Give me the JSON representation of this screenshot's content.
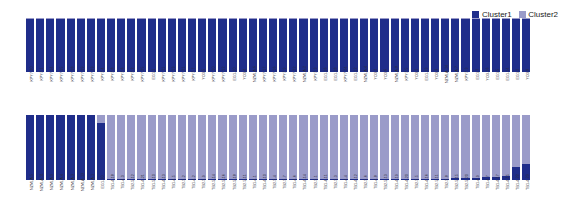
{
  "legend": {
    "position": "top-right",
    "entries": [
      {
        "label": "Cluster1",
        "color": "#1f2d8a",
        "swatch_name": "cluster1-swatch"
      },
      {
        "label": "Cluster2",
        "color": "#9a9bc9",
        "swatch_name": "cluster2-swatch"
      }
    ]
  },
  "chart_data": {
    "type": "bar",
    "subtype": "stacked-structure-admixture",
    "title": "",
    "subtitle": "",
    "xlabel": "",
    "ylabel": "",
    "ylim": [
      0,
      1
    ],
    "grid": false,
    "legend_position": "top-right",
    "stacked": true,
    "normalized": true,
    "k": 2,
    "series": [
      {
        "name": "Cluster1",
        "color": "#1f2d8a"
      },
      {
        "name": "Cluster2",
        "color": "#9a9bc9"
      }
    ],
    "panels": [
      {
        "name": "top-panel",
        "categories": [
          "KPY7-20",
          "KPY7-1",
          "KPY7-14",
          "KPY7-15",
          "KPY7-18",
          "KPY7-19",
          "KPY7-23",
          "KPY7-4",
          "KPY7-8",
          "KPY7-6",
          "KPY7-2",
          "KPY7-25",
          "EG1-1",
          "KPY7-11",
          "KPY7-13",
          "KPY7-21",
          "KPY7-7",
          "YO3-5",
          "KPY7-10",
          "KPY7-12",
          "EG1-10",
          "YO3-4",
          "NZMLA-6",
          "KPY7-17",
          "KPY7-16",
          "KPY7-9",
          "KPY7-22",
          "NZMLA-2",
          "KPY7-3",
          "EG1-16",
          "EG1-18",
          "KPY7-24",
          "EG1-12",
          "NZMLA-4",
          "YO3-2",
          "YO3-6",
          "NZMLA-8",
          "KPY7-5",
          "YO3-1",
          "EG1-13",
          "YO3-3",
          "NZMLA-14",
          "NZMLA-7",
          "KPY7-3",
          "EG1-7",
          "YO3-16",
          "EG1-5",
          "EG1-14",
          "EG1-2",
          "YO3-8"
        ],
        "values": [
          [
            0.99,
            0.01
          ],
          [
            0.99,
            0.01
          ],
          [
            0.99,
            0.01
          ],
          [
            0.99,
            0.01
          ],
          [
            0.99,
            0.01
          ],
          [
            0.99,
            0.01
          ],
          [
            0.98,
            0.02
          ],
          [
            0.99,
            0.01
          ],
          [
            0.99,
            0.01
          ],
          [
            0.99,
            0.01
          ],
          [
            0.98,
            0.02
          ],
          [
            0.99,
            0.01
          ],
          [
            0.99,
            0.01
          ],
          [
            0.99,
            0.01
          ],
          [
            0.98,
            0.02
          ],
          [
            0.99,
            0.01
          ],
          [
            0.99,
            0.01
          ],
          [
            0.98,
            0.02
          ],
          [
            0.99,
            0.01
          ],
          [
            0.99,
            0.01
          ],
          [
            0.98,
            0.02
          ],
          [
            0.99,
            0.01
          ],
          [
            0.99,
            0.01
          ],
          [
            0.99,
            0.01
          ],
          [
            0.98,
            0.02
          ],
          [
            0.99,
            0.01
          ],
          [
            0.99,
            0.01
          ],
          [
            0.99,
            0.01
          ],
          [
            0.98,
            0.02
          ],
          [
            0.99,
            0.01
          ],
          [
            0.99,
            0.01
          ],
          [
            0.99,
            0.01
          ],
          [
            0.98,
            0.02
          ],
          [
            0.99,
            0.01
          ],
          [
            0.99,
            0.01
          ],
          [
            0.98,
            0.02
          ],
          [
            0.99,
            0.01
          ],
          [
            0.99,
            0.01
          ],
          [
            0.98,
            0.02
          ],
          [
            0.99,
            0.01
          ],
          [
            0.99,
            0.01
          ],
          [
            0.98,
            0.02
          ],
          [
            0.99,
            0.01
          ],
          [
            0.99,
            0.01
          ],
          [
            0.98,
            0.02
          ],
          [
            0.99,
            0.01
          ],
          [
            0.99,
            0.01
          ],
          [
            0.98,
            0.02
          ],
          [
            0.99,
            0.01
          ],
          [
            0.99,
            0.01
          ]
        ]
      },
      {
        "name": "bottom-panel",
        "categories": [
          "NZMLA-5",
          "NZMLA-11",
          "NZMLA-9",
          "NZMLA-4",
          "NZMLA-3",
          "NZMLA-13",
          "NZMLA-1",
          "EG1-10",
          "TB1-4-18",
          "TB1-4-3",
          "TB2-5-12",
          "TB1-4-21",
          "TB1-5-10",
          "TB1-4-13",
          "TB1-4-5",
          "TB2-5-2",
          "TB1-4-2",
          "TB2-5-9",
          "TB2-5-14",
          "TB2-5-16",
          "TB2-5-18",
          "TB2-5-11",
          "TB1-4-1",
          "TB1-4-10",
          "TB2-5-4",
          "TB2-5-7",
          "TB1-4-6",
          "TB1-4-14",
          "TB2-5-1",
          "TB1-4-11",
          "TB2-5-3",
          "TB1-4-4",
          "TB1-4-12",
          "TB2-5-6",
          "TB1-4-8",
          "TB2-5-13",
          "TB1-4-19",
          "TB1-4-20",
          "TB2-5-5",
          "TB1-4-16",
          "TB2-5-11",
          "TB2-5-8",
          "TB2-5-15",
          "TB2-5-20",
          "TB1-4-9",
          "TB1-4-7",
          "TB1-4-17",
          "TB1-4-15",
          "TB1-4-22",
          "TB1-4-23"
        ],
        "values": [
          [
            1.0,
            0.0
          ],
          [
            1.0,
            0.0
          ],
          [
            1.0,
            0.0
          ],
          [
            1.0,
            0.0
          ],
          [
            1.0,
            0.0
          ],
          [
            1.0,
            0.0
          ],
          [
            1.0,
            0.0
          ],
          [
            0.88,
            0.12
          ],
          [
            0.02,
            0.98
          ],
          [
            0.02,
            0.98
          ],
          [
            0.02,
            0.98
          ],
          [
            0.02,
            0.98
          ],
          [
            0.02,
            0.98
          ],
          [
            0.02,
            0.98
          ],
          [
            0.02,
            0.98
          ],
          [
            0.02,
            0.98
          ],
          [
            0.02,
            0.98
          ],
          [
            0.02,
            0.98
          ],
          [
            0.02,
            0.98
          ],
          [
            0.02,
            0.98
          ],
          [
            0.02,
            0.98
          ],
          [
            0.02,
            0.98
          ],
          [
            0.02,
            0.98
          ],
          [
            0.02,
            0.98
          ],
          [
            0.02,
            0.98
          ],
          [
            0.02,
            0.98
          ],
          [
            0.02,
            0.98
          ],
          [
            0.02,
            0.98
          ],
          [
            0.02,
            0.98
          ],
          [
            0.02,
            0.98
          ],
          [
            0.02,
            0.98
          ],
          [
            0.02,
            0.98
          ],
          [
            0.02,
            0.98
          ],
          [
            0.02,
            0.98
          ],
          [
            0.02,
            0.98
          ],
          [
            0.02,
            0.98
          ],
          [
            0.02,
            0.98
          ],
          [
            0.02,
            0.98
          ],
          [
            0.02,
            0.98
          ],
          [
            0.02,
            0.98
          ],
          [
            0.02,
            0.98
          ],
          [
            0.02,
            0.98
          ],
          [
            0.03,
            0.97
          ],
          [
            0.03,
            0.97
          ],
          [
            0.03,
            0.97
          ],
          [
            0.04,
            0.96
          ],
          [
            0.05,
            0.95
          ],
          [
            0.06,
            0.94
          ],
          [
            0.2,
            0.8
          ],
          [
            0.25,
            0.75
          ]
        ]
      }
    ]
  }
}
